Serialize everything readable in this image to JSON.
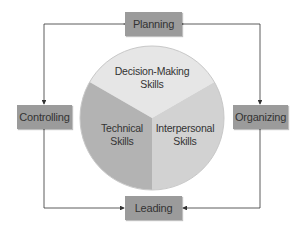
{
  "diagram": {
    "functions": {
      "top": "Planning",
      "right": "Organizing",
      "bottom": "Leading",
      "left": "Controlling"
    },
    "skills": {
      "top": [
        "Decision-Making",
        "Skills"
      ],
      "left": [
        "Technical",
        "Skills"
      ],
      "right": [
        "Interpersonal",
        "Skills"
      ]
    },
    "colors": {
      "box_fill": "#9b9b9b",
      "line": "#333333",
      "slice_top": "#e6e6e6",
      "slice_left": "#b3b3b3",
      "slice_right": "#d2d2d2",
      "text": "#333333"
    }
  }
}
